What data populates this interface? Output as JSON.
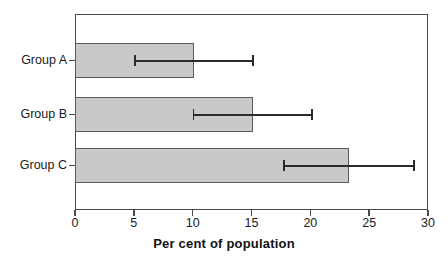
{
  "chart_data": {
    "type": "bar",
    "orientation": "horizontal",
    "title": "",
    "subtitle": "",
    "xlabel": "Per cent of population",
    "ylabel": "",
    "categories": [
      "Group A",
      "Group B",
      "Group C"
    ],
    "values": [
      10.1,
      15.1,
      23.3
    ],
    "error_low": [
      5.0,
      10.0,
      17.7
    ],
    "error_high": [
      15.2,
      20.2,
      28.9
    ],
    "series": [
      {
        "name": "Per cent of population",
        "values": [
          10.1,
          15.1,
          23.3
        ],
        "error_low": [
          5.0,
          10.0,
          17.7
        ],
        "error_high": [
          15.2,
          20.2,
          28.9
        ]
      }
    ],
    "xlim": [
      0,
      30
    ],
    "xticks": [
      0,
      5,
      10,
      15,
      20,
      25,
      30
    ],
    "xticklabels": [
      "0",
      "5",
      "10",
      "15",
      "20",
      "25",
      "30"
    ],
    "grid": false,
    "legend": false,
    "legend_position": "none",
    "bar_color": "#c9c9c9",
    "bar_edge_color": "#5a5a5a",
    "error_bar_color": "#2b2b2b",
    "axis_color": "#4a4a4a",
    "background_color": "#ffffff"
  }
}
